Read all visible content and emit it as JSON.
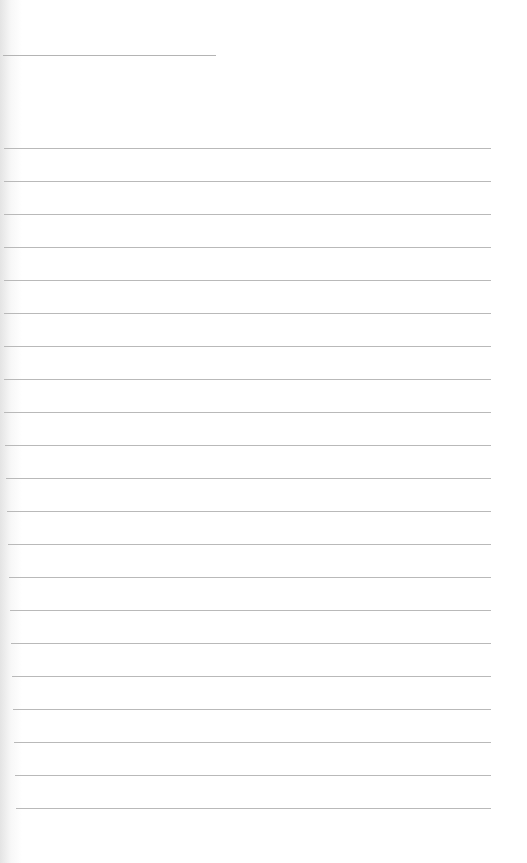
{
  "document": {
    "type": "lined-notepad-page",
    "header_line": {
      "x": 3,
      "y": 55,
      "width": 213
    },
    "ruled_lines": {
      "count": 21,
      "first_y": 148,
      "spacing": 33,
      "right_edge": 491,
      "color": "#b9b9b9"
    },
    "content": []
  }
}
